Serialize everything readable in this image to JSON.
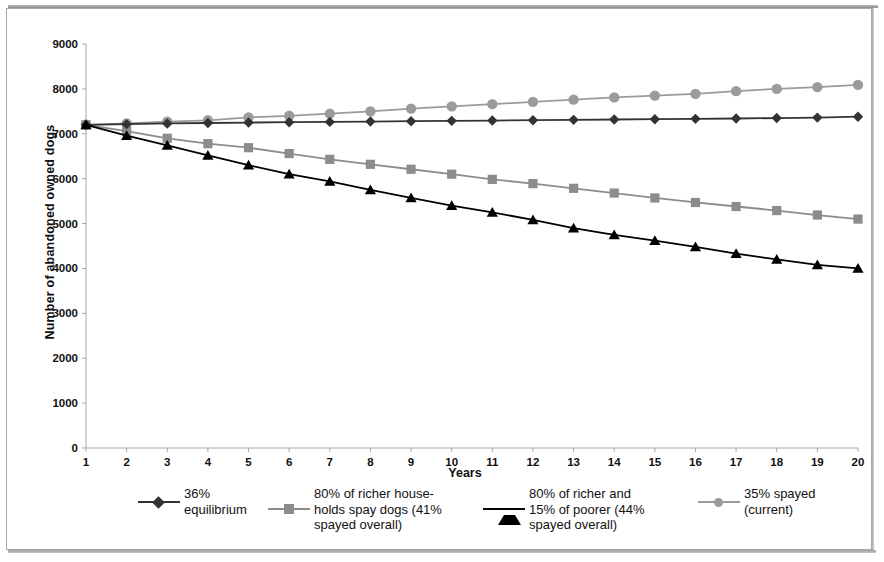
{
  "chart_data": {
    "type": "line",
    "title": "",
    "xlabel": "Years",
    "ylabel": "Number of abandoned owned dogs",
    "xlim": [
      1,
      20
    ],
    "ylim": [
      0,
      9000
    ],
    "ytick_step": 1000,
    "grid": false,
    "legend_position": "bottom",
    "x": [
      1,
      2,
      3,
      4,
      5,
      6,
      7,
      8,
      9,
      10,
      11,
      12,
      13,
      14,
      15,
      16,
      17,
      18,
      19,
      20
    ],
    "xticklabels": [
      "1",
      "2",
      "3",
      "4",
      "5",
      "6",
      "7",
      "8",
      "9",
      "10",
      "11",
      "12",
      "13",
      "14",
      "15",
      "16",
      "17",
      "18",
      "19",
      "20"
    ],
    "yticklabels": [
      "0",
      "1000",
      "2000",
      "3000",
      "4000",
      "5000",
      "6000",
      "7000",
      "8000",
      "9000"
    ],
    "series": [
      {
        "name": "36% equilibrium",
        "marker": "diamond",
        "color": "#333333",
        "line_color": "#333333",
        "values": [
          7200,
          7215,
          7230,
          7240,
          7250,
          7258,
          7265,
          7272,
          7280,
          7288,
          7295,
          7302,
          7310,
          7318,
          7325,
          7332,
          7340,
          7350,
          7360,
          7380
        ]
      },
      {
        "name": "80% of richer households spay dogs (41% spayed overall)",
        "marker": "square",
        "color": "#8c8c8c",
        "line_color": "#8c8c8c",
        "values": [
          7200,
          7060,
          6900,
          6780,
          6690,
          6560,
          6430,
          6320,
          6210,
          6100,
          5985,
          5890,
          5785,
          5680,
          5570,
          5470,
          5380,
          5290,
          5190,
          5100
        ]
      },
      {
        "name": "80% of richer and 15% of poorer (44% spayed overall)",
        "marker": "triangle",
        "color": "#000000",
        "line_color": "#000000",
        "values": [
          7200,
          6960,
          6740,
          6520,
          6300,
          6100,
          5940,
          5750,
          5570,
          5400,
          5250,
          5080,
          4900,
          4750,
          4620,
          4480,
          4330,
          4200,
          4080,
          4000
        ]
      },
      {
        "name": "35% spayed (current)",
        "marker": "circle",
        "color": "#9b9b9b",
        "line_color": "#9b9b9b",
        "values": [
          7200,
          7230,
          7270,
          7300,
          7365,
          7400,
          7450,
          7500,
          7560,
          7610,
          7660,
          7710,
          7760,
          7810,
          7850,
          7890,
          7950,
          8000,
          8040,
          8090
        ]
      }
    ]
  },
  "legend": {
    "items": [
      {
        "label": "36% equilibrium",
        "marker": "diamond-marker-icon",
        "color": "#333333"
      },
      {
        "label": "80% of richer house-\nholds spay dogs (41%\nspayed overall)",
        "marker": "square-marker-icon",
        "color": "#8c8c8c"
      },
      {
        "label": "80% of richer and\n15% of poorer (44%\nspayed overall)",
        "marker": "triangle-marker-icon",
        "color": "#000000"
      },
      {
        "label": "35% spayed\n(current)",
        "marker": "circle-marker-icon",
        "color": "#9b9b9b"
      }
    ]
  }
}
